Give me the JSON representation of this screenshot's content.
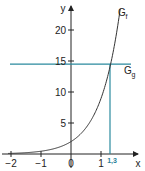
{
  "chart_data": {
    "type": "line",
    "title": "",
    "xlabel": "x",
    "ylabel": "y",
    "xlim": [
      -2.1,
      2.2
    ],
    "ylim": [
      0,
      24
    ],
    "grid": false,
    "x_ticks": [
      -2,
      -1,
      0,
      1
    ],
    "x_tick_labels": [
      "−2",
      "−1",
      "0",
      "1"
    ],
    "y_ticks": [
      5,
      10,
      15,
      20
    ],
    "y_tick_labels": [
      "5",
      "10",
      "15",
      "20"
    ],
    "series": [
      {
        "name": "G_f",
        "label_main": "G",
        "label_sub": "f",
        "kind": "exponential curve",
        "formula_estimate": "y = 2·e^(1.5x)",
        "x": [
          -2,
          -1.5,
          -1,
          -0.5,
          0,
          0.5,
          1,
          1.2,
          1.3,
          1.5,
          1.7
        ],
        "values": [
          0.1,
          0.21,
          0.45,
          0.94,
          2.0,
          4.23,
          8.96,
          12.1,
          14.1,
          19.0,
          25.6
        ],
        "color": "#333333"
      },
      {
        "name": "G_g",
        "label_main": "G",
        "label_sub": "g",
        "kind": "horizontal line",
        "y_value": 14.5,
        "color": "#2a8a9e"
      }
    ],
    "annotations": [
      {
        "type": "vertical-line",
        "x": 1.3,
        "label": "1,3",
        "color": "#2a8a9e"
      }
    ]
  }
}
